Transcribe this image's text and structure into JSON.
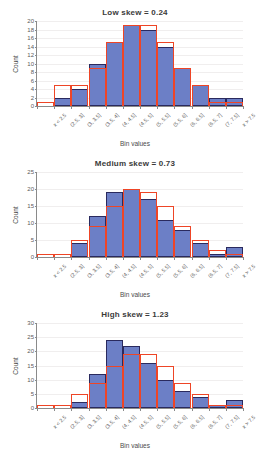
{
  "figure": {
    "bin_labels": [
      "x < 2.5",
      "(2.5, 3]",
      "(3, 3.5]",
      "(3.5, 4]",
      "(4, 4.5]",
      "(4.5, 5]",
      "(5, 5.5]",
      "(5.5, 6]",
      "(6, 6.5]",
      "(6.5, 7]",
      "(7, 7.5]",
      "x > 7.5"
    ],
    "xlabel": "Bin values",
    "ylabel": "Count",
    "bar_color": "#6C7FC6",
    "bar_edge_color": "#2A2A5E",
    "outline_color": "#EE4526",
    "grid_color": "#F0EEEE",
    "axis_color": "#8A8A8A"
  },
  "chart_data": [
    {
      "type": "bar",
      "title": "Low skew = 0.24",
      "xlabel": "Bin values",
      "ylabel": "Count",
      "categories": [
        "x < 2.5",
        "(2.5, 3]",
        "(3, 3.5]",
        "(3.5, 4]",
        "(4, 4.5]",
        "(4.5, 5]",
        "(5, 5.5]",
        "(5.5, 6]",
        "(6, 6.5]",
        "(6.5, 7]",
        "(7, 7.5]",
        "x > 7.5"
      ],
      "ylim": [
        0,
        20
      ],
      "yticks": [
        0,
        2,
        4,
        6,
        8,
        10,
        12,
        14,
        16,
        18,
        20
      ],
      "grid": true,
      "legend": "none",
      "series": [
        {
          "name": "Observed counts",
          "kind": "filled-bars",
          "values": [
            0,
            2,
            4,
            10,
            15,
            19,
            18,
            14,
            9,
            5,
            2,
            2
          ]
        },
        {
          "name": "Expected counts",
          "kind": "step-outline",
          "values": [
            1,
            5,
            5,
            9,
            15,
            19,
            19,
            15,
            9,
            5,
            1,
            1
          ]
        }
      ]
    },
    {
      "type": "bar",
      "title": "Medium skew = 0.73",
      "xlabel": "Bin values",
      "ylabel": "Count",
      "categories": [
        "x < 2.5",
        "(2.5, 3]",
        "(3, 3.5]",
        "(3.5, 4]",
        "(4, 4.5]",
        "(4.5, 5]",
        "(5, 5.5]",
        "(5.5, 6]",
        "(6, 6.5]",
        "(6.5, 7]",
        "(7, 7.5]",
        "x > 7.5"
      ],
      "ylim": [
        0,
        25
      ],
      "yticks": [
        0,
        5,
        10,
        15,
        20,
        25
      ],
      "grid": true,
      "legend": "none",
      "series": [
        {
          "name": "Observed counts",
          "kind": "filled-bars",
          "values": [
            0,
            0,
            4,
            12,
            19,
            20,
            17,
            11,
            8,
            4,
            1,
            3
          ]
        },
        {
          "name": "Expected counts",
          "kind": "step-outline",
          "values": [
            1,
            1,
            5,
            9,
            15,
            20,
            19,
            15,
            9,
            5,
            2,
            1
          ]
        }
      ]
    },
    {
      "type": "bar",
      "title": "High skew = 1.23",
      "xlabel": "Bin values",
      "ylabel": "Count",
      "categories": [
        "x < 2.5",
        "(2.5, 3]",
        "(3, 3.5]",
        "(3.5, 4]",
        "(4, 4.5]",
        "(4.5, 5]",
        "(5, 5.5]",
        "(5.5, 6]",
        "(6, 6.5]",
        "(6.5, 7]",
        "(7, 7.5]",
        "x > 7.5"
      ],
      "ylim": [
        0,
        30
      ],
      "yticks": [
        0,
        5,
        10,
        15,
        20,
        25,
        30
      ],
      "grid": true,
      "legend": "none",
      "series": [
        {
          "name": "Observed counts",
          "kind": "filled-bars",
          "values": [
            0,
            0,
            2,
            12,
            24,
            22,
            16,
            10,
            6,
            4,
            1,
            3
          ]
        },
        {
          "name": "Expected counts",
          "kind": "step-outline",
          "values": [
            1,
            1,
            5,
            9,
            15,
            19,
            19,
            15,
            9,
            5,
            1,
            1
          ]
        }
      ]
    }
  ]
}
